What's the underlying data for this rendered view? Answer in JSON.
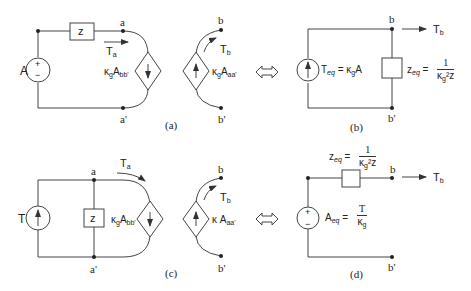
{
  "panels": {
    "a": {
      "caption": "(a)",
      "source_label": "A",
      "source_plus": "+",
      "source_minus": "−",
      "impedance": "z",
      "node_a": "a",
      "node_a_prime": "a'",
      "node_b": "b",
      "node_b_prime": "b'",
      "flow_left": "T",
      "flow_left_sub": "a",
      "flow_right": "T",
      "flow_right_sub": "b",
      "dep_left_k": "κ",
      "dep_left_k_sub": "g",
      "dep_left_var": "A",
      "dep_left_sub": "bb'",
      "dep_right_k": "κ",
      "dep_right_k_sub": "g",
      "dep_right_var": "A",
      "dep_right_sub": "aa'"
    },
    "b": {
      "caption": "(b)",
      "node_b": "b",
      "node_b_prime": "b'",
      "flow": "T",
      "flow_sub": "b",
      "source_label": "T",
      "source_label_sub": "eq",
      "source_expr": " = κ",
      "source_expr_sub": "g",
      "source_expr_tail": "A",
      "imp_label": "z",
      "imp_label_sub": "eq",
      "imp_eq": " = ",
      "imp_num": "1",
      "imp_den": "κ",
      "imp_den_sub": "g",
      "imp_den_tail": "²z"
    },
    "c": {
      "caption": "(c)",
      "source_label": "T",
      "impedance": "z",
      "node_a": "a",
      "node_a_prime": "a'",
      "node_b": "b",
      "node_b_prime": "b'",
      "flow_left": "T",
      "flow_left_sub": "a",
      "flow_right": "T",
      "flow_right_sub": "b",
      "dep_left_k": "κ",
      "dep_left_k_sub": "g",
      "dep_left_var": "A",
      "dep_left_sub": "bb'",
      "dep_right_k": "κ",
      "dep_right_var": " A",
      "dep_right_sub": "aa'"
    },
    "d": {
      "caption": "(d)",
      "node_b": "b",
      "node_b_prime": "b'",
      "flow": "T",
      "flow_sub": "b",
      "source_plus": "+",
      "source_minus": "−",
      "source_label": "A",
      "source_label_sub": "eq",
      "source_eq": " = ",
      "source_num": "T",
      "source_den": "κ",
      "source_den_sub": "g",
      "imp_label": "z",
      "imp_label_sub": "eq",
      "imp_eq": " = ",
      "imp_num": "1",
      "imp_den": "κ",
      "imp_den_sub": "g",
      "imp_den_tail": "²z"
    }
  },
  "equivalence_symbol": "⇔"
}
